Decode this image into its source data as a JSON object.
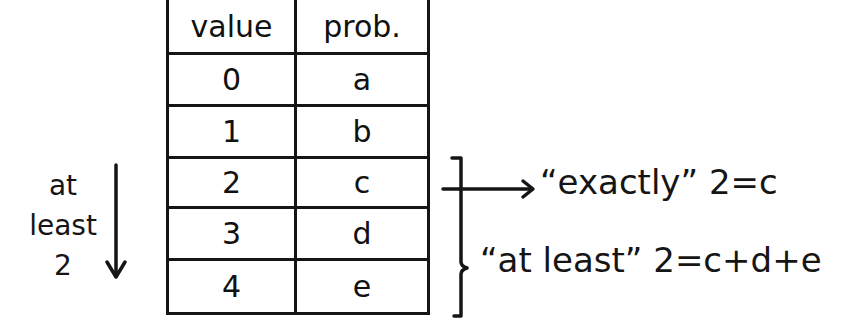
{
  "table": {
    "headers": [
      "value",
      "prob."
    ],
    "rows": [
      {
        "value": "0",
        "prob": "a"
      },
      {
        "value": "1",
        "prob": "b"
      },
      {
        "value": "2",
        "prob": "c"
      },
      {
        "value": "3",
        "prob": "d"
      },
      {
        "value": "4",
        "prob": "e"
      }
    ]
  },
  "left_annotation": {
    "line1": "at",
    "line2": "least",
    "line3": "2",
    "arrow": "down-arrow"
  },
  "right_annotations": {
    "exactly": "“exactly” 2=c",
    "at_least": "“at least” 2=c+d+e"
  },
  "colors": {
    "ink": "#151515",
    "background": "#ffffff"
  }
}
